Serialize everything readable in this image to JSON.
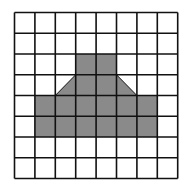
{
  "grid": {
    "rows": 8,
    "cols": 8,
    "origin_x": 14.5,
    "origin_y": 12.5,
    "cell_w": 20.4,
    "cell_h": 20.75,
    "line_color": "#111111",
    "line_width": 1.6,
    "fill_color": "#8a8a8a"
  },
  "shape": {
    "full_cells": [
      [
        2,
        3
      ],
      [
        2,
        4
      ],
      [
        3,
        3
      ],
      [
        3,
        4
      ],
      [
        4,
        1
      ],
      [
        4,
        2
      ],
      [
        4,
        3
      ],
      [
        4,
        4
      ],
      [
        4,
        5
      ],
      [
        4,
        6
      ],
      [
        5,
        1
      ],
      [
        5,
        2
      ],
      [
        5,
        3
      ],
      [
        5,
        4
      ],
      [
        5,
        5
      ],
      [
        5,
        6
      ]
    ],
    "half_cells": [
      {
        "row": 3,
        "col": 2,
        "half": "lower-right"
      },
      {
        "row": 3,
        "col": 5,
        "half": "lower-left"
      }
    ]
  }
}
